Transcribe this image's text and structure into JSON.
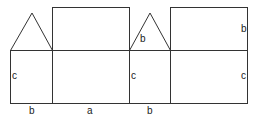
{
  "diagram": {
    "type": "net of triangular prism / house shape",
    "stroke_color": "#333333",
    "labels": {
      "left_square_side": "c",
      "left_square_bottom": "b",
      "middle_rect_bottom": "a",
      "second_square_side": "c",
      "second_square_bottom": "b",
      "triangle_side": "b",
      "right_rect_upper_side": "b",
      "right_rect_lower_side": "c"
    }
  }
}
